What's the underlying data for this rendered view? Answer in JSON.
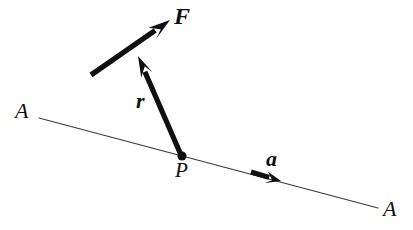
{
  "figure": {
    "kind": "free-body-vector-diagram",
    "caption": "",
    "background_color": "#ffffff",
    "ink_color": "#101010",
    "line_color": "#3a3a3a",
    "width": 413,
    "height": 230
  },
  "labels": {
    "force": "F",
    "position": "r",
    "axis_direction": "a",
    "point": "P",
    "axis_left": "A",
    "axis_right": "A"
  },
  "geometry": {
    "axis_line": {
      "name": "A-A",
      "x1": 39,
      "y1": 118,
      "x2": 378,
      "y2": 208,
      "stroke_width": 1.2
    },
    "point_P": {
      "cx": 182,
      "cy": 156,
      "r": 4.6
    },
    "vector_F": {
      "tail_x": 91,
      "tail_y": 75,
      "tip_x": 170,
      "tip_y": 20,
      "shaft_width": 5.2,
      "head_length": 22,
      "head_half_width": 7.5
    },
    "vector_r": {
      "tail_x": 181,
      "tail_y": 155,
      "tip_x": 138,
      "tip_y": 56,
      "shaft_width": 5.2,
      "head_length": 21,
      "head_half_width": 7
    },
    "vector_a": {
      "tail_x": 251,
      "tail_y": 172,
      "tip_x": 281,
      "tip_y": 181,
      "shaft_width": 5.0,
      "head_length": 15,
      "head_half_width": 6.5
    }
  },
  "icons": {
    "point_marker": "filled-dot",
    "arrow_marker": "solid-triangle-arrowhead"
  }
}
